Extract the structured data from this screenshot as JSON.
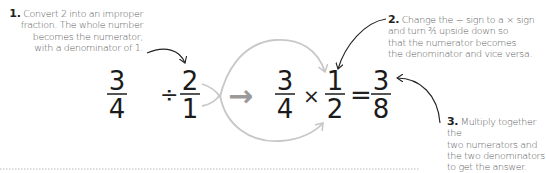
{
  "notes": [
    {
      "number": "1.",
      "lines": [
        "Convert 2 into an improper",
        "fraction. The whole number",
        "becomes the numerator,",
        "with a denominator of 1."
      ]
    },
    {
      "number": "2.",
      "lines": [
        "Change the ÷ sign to a × sign",
        "and turn ²⁄₁ upside down so",
        "that the numerator becomes",
        "the denominator and vice versa."
      ]
    },
    {
      "number": "3.",
      "lines": [
        "Multiply together the",
        "two numerators and",
        "the two denominators",
        "to get the answer."
      ]
    }
  ],
  "equation": {
    "left": [
      {
        "num": "3",
        "den": "4"
      },
      {
        "op": "÷"
      },
      {
        "num": "2",
        "den": "1"
      }
    ],
    "arrow": "→",
    "right": [
      {
        "num": "3",
        "den": "4"
      },
      {
        "op": "×"
      },
      {
        "num": "1",
        "den": "2"
      },
      {
        "op": "="
      },
      {
        "num": "3",
        "den": "8"
      }
    ]
  },
  "colors": {
    "text": "#1b1b1b",
    "note": "#5a5a5a",
    "arrow_gray": "#9a9a9a",
    "swap_curve": "#c8c8c8"
  }
}
